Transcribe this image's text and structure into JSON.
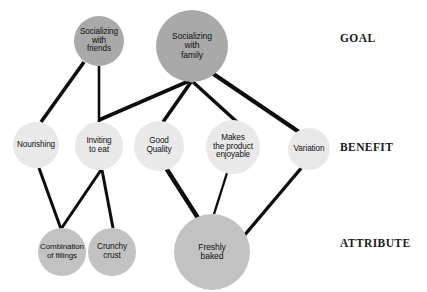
{
  "diagram": {
    "background_color": "#ffffff",
    "width": 427,
    "height": 292,
    "level_colors": {
      "goal": "#a9a9a9",
      "benefit": "#e9e9e9",
      "attribute": "#c2c2c2"
    },
    "edge_color": "#0d0d0d"
  },
  "level_labels": [
    {
      "id": "goal",
      "text": "GOAL",
      "x": 340,
      "y": 32,
      "size": 11.5
    },
    {
      "id": "benefit",
      "text": "BENEFIT",
      "x": 340,
      "y": 141,
      "size": 11.5
    },
    {
      "id": "attribute",
      "text": "ATTRIBUTE",
      "x": 340,
      "y": 237,
      "size": 11.5
    }
  ],
  "nodes": [
    {
      "id": "socializing-with-friends",
      "label": "Socializing\nwith\nfriends",
      "level": "goal",
      "cx": 99,
      "cy": 41,
      "r": 25,
      "font_size": 8.2,
      "color": "#a9a9a9"
    },
    {
      "id": "socializing-with-family",
      "label": "Socializing\nwith\nfamily",
      "level": "goal",
      "cx": 192,
      "cy": 46,
      "r": 36,
      "font_size": 8.6,
      "color": "#a9a9a9"
    },
    {
      "id": "nourishing",
      "label": "Nourishing",
      "level": "benefit",
      "cx": 36,
      "cy": 145,
      "r": 23,
      "font_size": 8.2,
      "color": "#e9e9e9"
    },
    {
      "id": "inviting-to-eat",
      "label": "Inviting\nto eat",
      "level": "benefit",
      "cx": 99,
      "cy": 146,
      "r": 24,
      "font_size": 8.2,
      "color": "#e9e9e9"
    },
    {
      "id": "good-quality",
      "label": "Good\nQuality",
      "level": "benefit",
      "cx": 159,
      "cy": 146,
      "r": 25,
      "font_size": 8.2,
      "color": "#e9e9e9"
    },
    {
      "id": "makes-the-product-enjoyable",
      "label": "Makes\nthe product\nenjoyable",
      "level": "benefit",
      "cx": 233,
      "cy": 147,
      "r": 27,
      "font_size": 8.2,
      "color": "#e9e9e9"
    },
    {
      "id": "variation",
      "label": "Variation",
      "level": "benefit",
      "cx": 309,
      "cy": 149,
      "r": 21,
      "font_size": 8.2,
      "color": "#e9e9e9"
    },
    {
      "id": "combination-of-fillings",
      "label": "Combination\nof fillings",
      "level": "attribute",
      "cx": 62,
      "cy": 252,
      "r": 24,
      "font_size": 8.0,
      "color": "#c2c2c2"
    },
    {
      "id": "crunchy-crust",
      "label": "Crunchy\ncrust",
      "level": "attribute",
      "cx": 112,
      "cy": 252,
      "r": 24,
      "font_size": 8.2,
      "color": "#c2c2c2"
    },
    {
      "id": "freshly-baked",
      "label": "Freshly\nbaked",
      "level": "attribute",
      "cx": 212,
      "cy": 252,
      "r": 38,
      "font_size": 8.6,
      "color": "#c2c2c2"
    }
  ],
  "edges": [
    {
      "id": "friends-to-nourishing",
      "from": "socializing-with-friends",
      "to": "nourishing",
      "x1": 84,
      "y1": 62,
      "x2": 41,
      "y2": 122,
      "width": 3.6
    },
    {
      "id": "friends-to-inviting",
      "from": "socializing-with-friends",
      "to": "inviting-to-eat",
      "x1": 99,
      "y1": 66,
      "x2": 99,
      "y2": 122,
      "width": 2.6
    },
    {
      "id": "family-to-inviting",
      "from": "socializing-with-family",
      "to": "inviting-to-eat",
      "x1": 189,
      "y1": 81,
      "x2": 99,
      "y2": 120,
      "width": 3.8
    },
    {
      "id": "family-to-good-quality",
      "from": "socializing-with-family",
      "to": "good-quality",
      "x1": 191,
      "y1": 82,
      "x2": 163,
      "y2": 122,
      "width": 3.6
    },
    {
      "id": "family-to-makes-enjoyable",
      "from": "socializing-with-family",
      "to": "makes-the-product-enjoyable",
      "x1": 193,
      "y1": 82,
      "x2": 237,
      "y2": 122,
      "width": 3.4
    },
    {
      "id": "family-to-variation",
      "from": "socializing-with-family",
      "to": "variation",
      "x1": 212,
      "y1": 73,
      "x2": 302,
      "y2": 134,
      "width": 4.2
    },
    {
      "id": "nourishing-to-combination",
      "from": "nourishing",
      "to": "combination-of-fillings",
      "x1": 39,
      "y1": 168,
      "x2": 61,
      "y2": 229,
      "width": 3.0
    },
    {
      "id": "inviting-to-combination",
      "from": "inviting-to-eat",
      "to": "combination-of-fillings",
      "x1": 101,
      "y1": 170,
      "x2": 61,
      "y2": 229,
      "width": 3.0
    },
    {
      "id": "inviting-to-crunchy",
      "from": "inviting-to-eat",
      "to": "crunchy-crust",
      "x1": 102,
      "y1": 170,
      "x2": 113,
      "y2": 228,
      "width": 3.0
    },
    {
      "id": "good-quality-to-freshly-baked",
      "from": "good-quality",
      "to": "freshly-baked",
      "x1": 166,
      "y1": 168,
      "x2": 198,
      "y2": 218,
      "width": 4.4
    },
    {
      "id": "makes-enjoyable-to-freshly-baked",
      "from": "makes-the-product-enjoyable",
      "to": "freshly-baked",
      "x1": 227,
      "y1": 173,
      "x2": 214,
      "y2": 214,
      "width": 2.4
    },
    {
      "id": "variation-to-freshly-baked",
      "from": "variation",
      "to": "freshly-baked",
      "x1": 303,
      "y1": 166,
      "x2": 243,
      "y2": 237,
      "width": 3.4
    }
  ]
}
